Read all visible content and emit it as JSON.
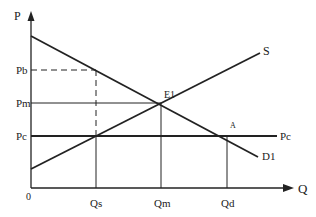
{
  "axes": {
    "y_label": "P",
    "x_label": "Q",
    "origin_label": "0"
  },
  "price_labels": {
    "pb": "Pb",
    "pm": "Pm",
    "pc": "Pc",
    "pc_right": "Pc"
  },
  "quantity_labels": {
    "qs": "Qs",
    "qm": "Qm",
    "qd": "Qd"
  },
  "curves": {
    "supply": "S",
    "demand": "D1"
  },
  "points": {
    "equilibrium": "E1",
    "a": "A"
  },
  "colors": {
    "line": "#222222",
    "background": "#ffffff"
  }
}
